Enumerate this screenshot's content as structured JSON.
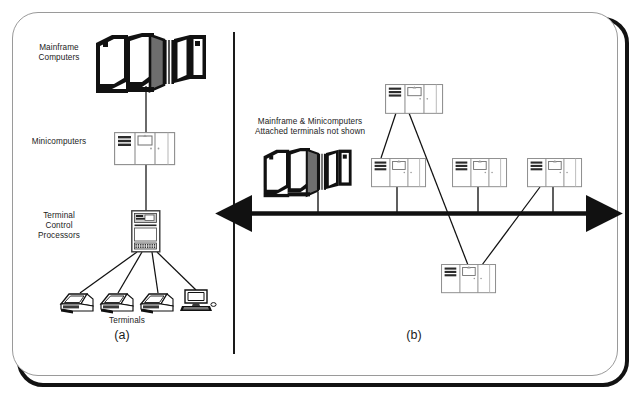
{
  "figure": {
    "background": "#ffffff",
    "ink": "#111111"
  },
  "panels": [
    {
      "id": "a",
      "letter": "(a)",
      "letter_pos": {
        "x": 122,
        "y": 328
      },
      "caption": "Hierarchical network",
      "labels": [
        {
          "name": "label-mainframe-computers",
          "text": "Mainframe\nComputers",
          "x": 16,
          "y": 43,
          "w": 86
        },
        {
          "name": "label-minicomputers",
          "text": "Minicomputers",
          "x": 16,
          "y": 137,
          "w": 86
        },
        {
          "name": "label-terminal-control-processors",
          "text": "Terminal\nControl\nProcessors",
          "x": 16,
          "y": 211,
          "w": 86
        },
        {
          "name": "label-terminals",
          "text": "Terminals",
          "x": 92,
          "y": 316,
          "w": 70
        }
      ],
      "nodes": [
        {
          "name": "mainframe-icon",
          "type": "mainframe",
          "x": 96,
          "y": 36,
          "w": 104,
          "h": 52
        },
        {
          "name": "minicomputer-icon",
          "type": "minicomputer",
          "x": 113,
          "y": 131,
          "w": 62,
          "h": 32
        },
        {
          "name": "terminal-control-processor-icon",
          "type": "tower",
          "x": 130,
          "y": 210,
          "w": 30,
          "h": 42
        },
        {
          "name": "terminal-icon-1",
          "type": "terminal",
          "x": 60,
          "y": 292,
          "w": 34,
          "h": 22
        },
        {
          "name": "terminal-icon-2",
          "type": "terminal",
          "x": 100,
          "y": 292,
          "w": 34,
          "h": 22
        },
        {
          "name": "terminal-icon-3",
          "type": "terminal",
          "x": 140,
          "y": 292,
          "w": 34,
          "h": 22
        },
        {
          "name": "terminal-icon-4",
          "type": "desktop-pc",
          "x": 180,
          "y": 288,
          "w": 34,
          "h": 27
        }
      ],
      "links": [
        {
          "name": "link-mainframe-minicomputer",
          "from": [
            146,
            86
          ],
          "to": [
            146,
            131
          ]
        },
        {
          "name": "link-minicomputer-tcp",
          "from": [
            146,
            163
          ],
          "to": [
            146,
            210
          ]
        },
        {
          "name": "link-tcp-terminal-1",
          "from": [
            137,
            252
          ],
          "to": [
            80,
            292
          ]
        },
        {
          "name": "link-tcp-terminal-2",
          "from": [
            142,
            252
          ],
          "to": [
            118,
            292
          ]
        },
        {
          "name": "link-tcp-terminal-3",
          "from": [
            152,
            252
          ],
          "to": [
            158,
            292
          ]
        },
        {
          "name": "link-tcp-terminal-4",
          "from": [
            157,
            252
          ],
          "to": [
            196,
            290
          ]
        }
      ]
    },
    {
      "id": "b",
      "letter": "(b)",
      "letter_pos": {
        "x": 414,
        "y": 328
      },
      "caption": "Bus / peer network",
      "labels": [
        {
          "name": "label-mainframe-and-minicomputers",
          "text": "Mainframe & Minicomputers\nAttached terminals not shown",
          "x": 242,
          "y": 117,
          "w": 136
        }
      ],
      "nodes": [
        {
          "name": "mainframe-icon-b",
          "type": "mainframe",
          "x": 262,
          "y": 150,
          "w": 84,
          "h": 44
        },
        {
          "name": "minicomputer-icon-b1",
          "type": "minicomputer",
          "x": 385,
          "y": 84,
          "w": 56,
          "h": 29
        },
        {
          "name": "minicomputer-icon-b2",
          "type": "minicomputer",
          "x": 371,
          "y": 158,
          "w": 56,
          "h": 29
        },
        {
          "name": "minicomputer-icon-b3",
          "type": "minicomputer",
          "x": 452,
          "y": 158,
          "w": 56,
          "h": 29
        },
        {
          "name": "minicomputer-icon-b4",
          "type": "minicomputer",
          "x": 527,
          "y": 158,
          "w": 56,
          "h": 29
        },
        {
          "name": "minicomputer-icon-b5",
          "type": "minicomputer",
          "x": 441,
          "y": 264,
          "w": 56,
          "h": 29
        }
      ],
      "bus": {
        "name": "network-bus",
        "y": 213,
        "x1": 248,
        "x2": 590,
        "arrow_left": true,
        "arrow_right": true
      },
      "links": [
        {
          "name": "drop-mainframe-bus",
          "from": [
            318,
            194
          ],
          "to": [
            318,
            213
          ]
        },
        {
          "name": "drop-mini2-bus",
          "from": [
            397,
            187
          ],
          "to": [
            397,
            213
          ]
        },
        {
          "name": "drop-mini3-bus",
          "from": [
            478,
            187
          ],
          "to": [
            478,
            213
          ]
        },
        {
          "name": "drop-mini4-bus",
          "from": [
            553,
            187
          ],
          "to": [
            553,
            213
          ]
        },
        {
          "name": "link-mini1-mini2",
          "from": [
            396,
            113
          ],
          "to": [
            381,
            158
          ]
        },
        {
          "name": "link-mini1-mini5",
          "from": [
            409,
            113
          ],
          "to": [
            468,
            264
          ]
        },
        {
          "name": "link-mini4-mini5",
          "from": [
            540,
            187
          ],
          "to": [
            482,
            264
          ]
        }
      ]
    }
  ]
}
